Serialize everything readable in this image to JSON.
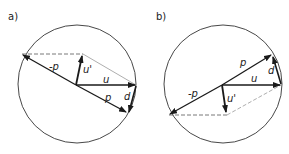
{
  "panels": [
    {
      "label": "a)",
      "vectors": {
        "neg_p": "-p",
        "u_prime": "u'",
        "u": "u",
        "p": "p",
        "d": "d"
      }
    },
    {
      "label": "b)",
      "vectors": {
        "neg_p": "-p",
        "u_prime": "u'",
        "u": "u",
        "p": "p",
        "d": "d"
      }
    }
  ],
  "colors": {
    "stroke": "#1a1a1a",
    "dashed": "#555555",
    "background": "#ffffff"
  }
}
